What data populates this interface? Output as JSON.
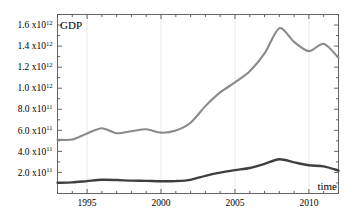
{
  "chart_data": {
    "type": "line",
    "title": "",
    "subtitle": "",
    "xlabel": "time",
    "ylabel": "GDP",
    "xlim": [
      1993,
      2012
    ],
    "ylim": [
      0,
      1700000000000
    ],
    "grid": "vertical-major-only",
    "legend": "none",
    "background_color": "#ffffff",
    "axis_color": "#555555",
    "gridline_color": "#e2e2e2",
    "x_major_ticks": [
      1995,
      2000,
      2005,
      2010
    ],
    "x_minor_tick_step": 1,
    "y_major_ticks": [
      200000000000,
      400000000000,
      600000000000,
      800000000000,
      1000000000000,
      1200000000000,
      1400000000000,
      1600000000000
    ],
    "y_tick_labels": [
      {
        "mantissa": "2.0 x10",
        "exponent": "11"
      },
      {
        "mantissa": "4.0 x10",
        "exponent": "11"
      },
      {
        "mantissa": "6.0 x10",
        "exponent": "11"
      },
      {
        "mantissa": "8.0 x10",
        "exponent": "11"
      },
      {
        "mantissa": "1.0 x10",
        "exponent": "12"
      },
      {
        "mantissa": "1.2 x10",
        "exponent": "12"
      },
      {
        "mantissa": "1.4 x10",
        "exponent": "12"
      },
      {
        "mantissa": "1.6 x10",
        "exponent": "12"
      }
    ],
    "x_tick_labels": [
      "1995",
      "2000",
      "2005",
      "2010"
    ],
    "x": [
      1993,
      1994,
      1995,
      1996,
      1997,
      1998,
      1999,
      2000,
      2001,
      2002,
      2003,
      2004,
      2005,
      2006,
      2007,
      2008,
      2009,
      2010,
      2011,
      2012
    ],
    "series": [
      {
        "name": "upper-series",
        "color": "#8a8a8a",
        "width": 2.1,
        "values": [
          510000000000,
          512000000000,
          570000000000,
          620000000000,
          572000000000,
          592000000000,
          610000000000,
          578000000000,
          598000000000,
          672000000000,
          830000000000,
          960000000000,
          1055000000000,
          1160000000000,
          1330000000000,
          1570000000000,
          1440000000000,
          1352000000000,
          1422000000000,
          1290000000000
        ]
      },
      {
        "name": "lower-series",
        "color": "#3f3f3f",
        "width": 2.4,
        "values": [
          102000000000,
          106000000000,
          118000000000,
          130000000000,
          128000000000,
          122000000000,
          120000000000,
          116000000000,
          118000000000,
          130000000000,
          168000000000,
          198000000000,
          222000000000,
          242000000000,
          282000000000,
          325000000000,
          296000000000,
          268000000000,
          258000000000,
          218000000000
        ]
      }
    ]
  },
  "labels": {
    "y_axis_name": "GDP",
    "x_axis_name": "time"
  }
}
